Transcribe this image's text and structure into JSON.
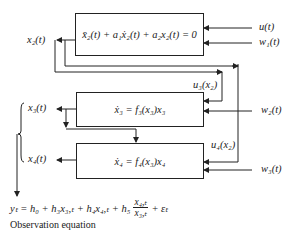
{
  "diagram": {
    "blocks": {
      "top": {
        "equation": "x̄₂(t) + a₁ẋ₂(t) + a₂x₂(t) = 0"
      },
      "middle": {
        "equation": "ẋ₃ = f₃(x₃)x₃"
      },
      "bottom": {
        "equation": "ẋ₄ = f₄(x₃)x₄"
      }
    },
    "inputs": {
      "u": "u(t)",
      "w1": "w₁(t)",
      "w2": "w₂(t)",
      "w3": "w₃(t)",
      "u3": "u₃(x₂)",
      "u4": "u₄(x₂)"
    },
    "outputs": {
      "x2": "x₂(t)",
      "x3": "x₃(t)",
      "x4": "x₄(t)"
    },
    "observation": {
      "lhs": "yₜ = h₀ + h₃x₃,ₜ + h₄x₄,ₜ + h₅",
      "frac_num": "x₄,ₜ",
      "frac_den": "x₃,ₜ",
      "tail": "+ εₜ",
      "caption": "Observation equation"
    },
    "colors": {
      "line": "#222222",
      "background": "#ffffff"
    }
  }
}
